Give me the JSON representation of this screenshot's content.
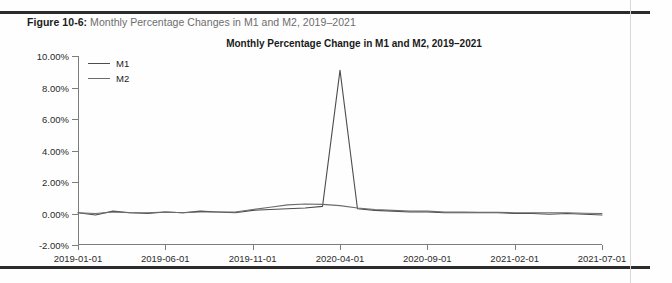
{
  "page": {
    "caption_prefix": "Figure 10-6:",
    "caption_text": " Monthly Percentage Changes in M1 and M2, 2019–2021"
  },
  "chart_data": {
    "type": "line",
    "title": "Monthly Percentage Change in M1 and M2, 2019–2021",
    "xlabel": "",
    "ylabel": "",
    "grid": false,
    "legend_position": "top-left-inside",
    "ylim": [
      -2.0,
      10.0
    ],
    "ytick_labels": [
      "10.00%",
      "8.00%",
      "6.00%",
      "4.00%",
      "2.00%",
      "0.00%",
      "-2.00%"
    ],
    "ytick_values": [
      10.0,
      8.0,
      6.0,
      4.0,
      2.0,
      0.0,
      -2.0
    ],
    "xtick_labels": [
      "2019-01-01",
      "2019-06-01",
      "2019-11-01",
      "2020-04-01",
      "2020-09-01",
      "2021-02-01",
      "2021-07-01"
    ],
    "xtick_positions": [
      0,
      5,
      10,
      15,
      20,
      25,
      30
    ],
    "xlim": [
      0,
      30
    ],
    "colors": {
      "M1": "#4d4d4d",
      "M2": "#6b6b6b",
      "axis": "#7d7d7d"
    },
    "x": [
      0,
      1,
      2,
      3,
      4,
      5,
      6,
      7,
      8,
      9,
      10,
      11,
      12,
      13,
      14,
      15,
      16,
      17,
      18,
      19,
      20,
      21,
      22,
      23,
      24,
      25,
      26,
      27,
      28,
      29,
      30
    ],
    "series": [
      {
        "name": "M1",
        "values": [
          0.05,
          -0.1,
          0.15,
          0.05,
          0.0,
          0.1,
          0.05,
          0.15,
          0.1,
          0.05,
          0.2,
          0.25,
          0.3,
          0.35,
          0.45,
          9.1,
          0.3,
          0.2,
          0.15,
          0.1,
          0.1,
          0.05,
          0.05,
          0.05,
          0.05,
          0.0,
          0.0,
          -0.05,
          0.0,
          -0.05,
          -0.1
        ]
      },
      {
        "name": "M2",
        "values": [
          0.05,
          0.0,
          0.1,
          0.05,
          0.05,
          0.1,
          0.05,
          0.1,
          0.1,
          0.1,
          0.25,
          0.4,
          0.55,
          0.6,
          0.58,
          0.5,
          0.35,
          0.25,
          0.2,
          0.15,
          0.15,
          0.1,
          0.1,
          0.08,
          0.08,
          0.05,
          0.05,
          0.05,
          0.05,
          0.02,
          0.0
        ]
      }
    ]
  },
  "legend": {
    "items": [
      {
        "label": "M1"
      },
      {
        "label": "M2"
      }
    ]
  }
}
